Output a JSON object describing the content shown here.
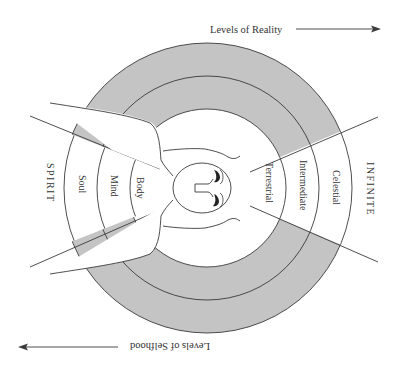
{
  "diagram": {
    "top_axis": {
      "label": "Levels of Reality",
      "direction": "right"
    },
    "bottom_axis": {
      "label": "Levels of Selfhood",
      "direction": "left",
      "rotated": 180
    },
    "left_region_label": "SPIRIT",
    "right_region_label": "INFINITE",
    "self_levels": [
      "Body",
      "Mind",
      "Soul"
    ],
    "reality_levels": [
      "Terrestrial",
      "Intermediate",
      "Celestial"
    ],
    "figure": "winged-head",
    "colors": {
      "ring_fill": "#c4c4c4",
      "line": "#3a3a3a",
      "background": "#ffffff",
      "text": "#333333"
    },
    "rings": [
      {
        "name": "outer",
        "radius": 145
      },
      {
        "name": "middle",
        "radius": 112
      },
      {
        "name": "inner",
        "radius": 79
      }
    ]
  }
}
